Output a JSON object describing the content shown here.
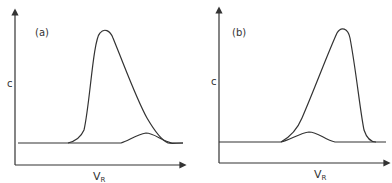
{
  "panels": [
    {
      "id": "a",
      "label": "(a)",
      "y_axis_label": "c",
      "x_axis_label": "V",
      "x_axis_subscript": "R",
      "description": "Large peak eluting early with small peak eluting later on its tail"
    },
    {
      "id": "b",
      "label": "(b)",
      "y_axis_label": "c",
      "x_axis_label": "V",
      "x_axis_subscript": "R",
      "description": "Small peak eluting early on the leading edge of a later large peak"
    }
  ],
  "colors": {
    "line": "#333333",
    "background": "#ffffff"
  }
}
